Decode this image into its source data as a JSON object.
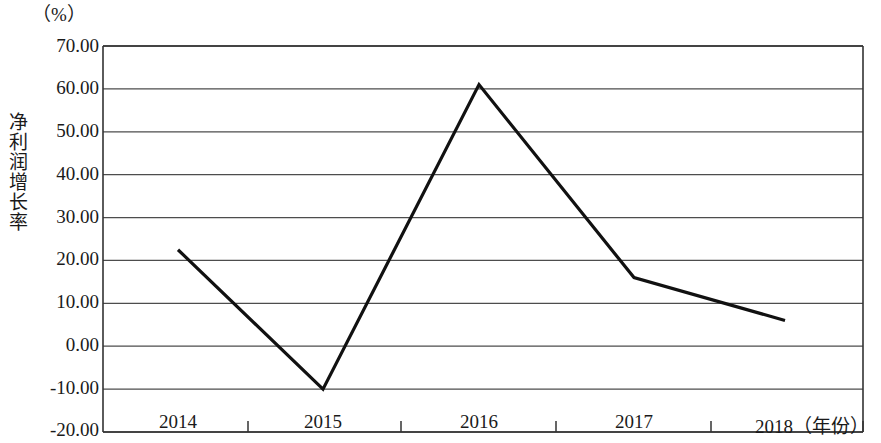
{
  "chart_data": {
    "type": "line",
    "title": "",
    "unit_label": "（%）",
    "ylabel": "净利润增长率",
    "xlabel": "（年份）",
    "categories": [
      "2014",
      "2015",
      "2016",
      "2017",
      "2018"
    ],
    "values": [
      22.5,
      -10.0,
      61.0,
      16.0,
      6.0
    ],
    "series": [
      {
        "name": "净利润增长率",
        "values": [
          22.5,
          -10.0,
          61.0,
          16.0,
          6.0
        ]
      }
    ],
    "ylim": [
      -20.0,
      70.0
    ],
    "ytick_labels": [
      "70.00",
      "60.00",
      "50.00",
      "40.00",
      "30.00",
      "20.00",
      "10.00",
      "0.00",
      "-10.00",
      "-20.00"
    ],
    "ytick_values": [
      70,
      60,
      50,
      40,
      30,
      20,
      10,
      0,
      -10,
      -20
    ],
    "grid": true,
    "legend": "none",
    "line_color": "#111111",
    "grid_color": "#4d4d4d",
    "axis_color": "#333333"
  }
}
